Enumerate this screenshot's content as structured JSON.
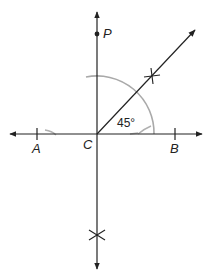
{
  "diagram": {
    "points": {
      "P": {
        "label": "P"
      },
      "A": {
        "label": "A"
      },
      "B": {
        "label": "B"
      },
      "C": {
        "label": "C"
      }
    },
    "angle_label": "45°",
    "colors": {
      "line": "#222222",
      "construction_arc": "#a6a6a6",
      "background": "#ffffff"
    }
  }
}
